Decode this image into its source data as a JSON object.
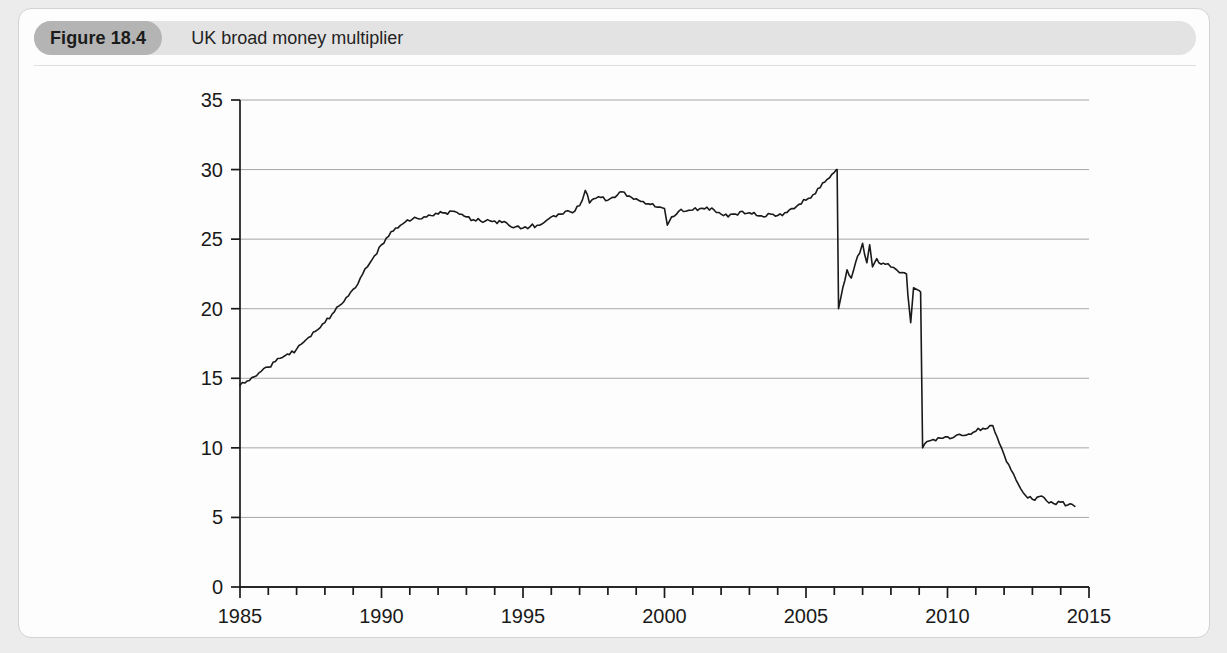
{
  "figure": {
    "number_label": "Figure 18.4",
    "title": "UK broad money multiplier"
  },
  "chart_data": {
    "type": "line",
    "title": "UK broad money multiplier",
    "xlabel": "",
    "ylabel": "",
    "xlim": [
      1985,
      2015
    ],
    "ylim": [
      0,
      35
    ],
    "grid": true,
    "legend": false,
    "y_ticks": [
      0,
      5,
      10,
      15,
      20,
      25,
      30,
      35
    ],
    "y_tick_labels": [
      "0",
      "5",
      "10",
      "15",
      "20",
      "25",
      "30",
      "35"
    ],
    "x_ticks": [
      1985,
      1990,
      1995,
      2000,
      2005,
      2010,
      2015
    ],
    "x_tick_labels": [
      "1985",
      "1990",
      "1995",
      "2000",
      "2005",
      "2010",
      "2015"
    ],
    "x_minor_tick_interval": 1,
    "line_color": "#1a1a1a",
    "line_width": 1.6,
    "series": [
      {
        "name": "UK broad money multiplier",
        "x": [
          1985.0,
          1985.25,
          1985.5,
          1985.75,
          1986.0,
          1986.25,
          1986.5,
          1986.75,
          1987.0,
          1987.25,
          1987.5,
          1987.75,
          1988.0,
          1988.25,
          1988.5,
          1988.75,
          1989.0,
          1989.25,
          1989.5,
          1989.75,
          1990.0,
          1990.25,
          1990.5,
          1990.75,
          1991.0,
          1991.25,
          1991.5,
          1991.75,
          1992.0,
          1992.25,
          1992.5,
          1992.75,
          1993.0,
          1993.25,
          1993.5,
          1993.75,
          1994.0,
          1994.25,
          1994.5,
          1994.75,
          1995.0,
          1995.25,
          1995.5,
          1995.75,
          1996.0,
          1996.25,
          1996.5,
          1996.75,
          1997.0,
          1997.2,
          1997.35,
          1997.5,
          1997.75,
          1998.0,
          1998.25,
          1998.5,
          1998.75,
          1999.0,
          1999.25,
          1999.5,
          1999.75,
          2000.0,
          2000.1,
          2000.25,
          2000.5,
          2000.75,
          2001.0,
          2001.25,
          2001.5,
          2001.75,
          2002.0,
          2002.25,
          2002.5,
          2002.75,
          2003.0,
          2003.25,
          2003.5,
          2003.75,
          2004.0,
          2004.25,
          2004.5,
          2004.75,
          2005.0,
          2005.25,
          2005.5,
          2005.75,
          2006.0,
          2006.08,
          2006.1,
          2006.15,
          2006.3,
          2006.45,
          2006.6,
          2006.75,
          2006.9,
          2007.0,
          2007.15,
          2007.25,
          2007.35,
          2007.5,
          2007.65,
          2007.8,
          2008.0,
          2008.2,
          2008.4,
          2008.55,
          2008.6,
          2008.7,
          2008.8,
          2008.9,
          2009.0,
          2009.05,
          2009.12,
          2009.2,
          2009.35,
          2009.5,
          2009.75,
          2010.0,
          2010.25,
          2010.5,
          2010.75,
          2011.0,
          2011.25,
          2011.5,
          2011.6,
          2011.75,
          2012.0,
          2012.25,
          2012.5,
          2012.75,
          2013.0,
          2013.25,
          2013.5,
          2013.75,
          2014.0,
          2014.25,
          2014.5
        ],
        "values": [
          14.5,
          14.8,
          15.1,
          15.5,
          15.8,
          16.2,
          16.5,
          16.7,
          17.1,
          17.6,
          18.0,
          18.5,
          19.0,
          19.6,
          20.2,
          20.8,
          21.4,
          22.2,
          23.0,
          23.8,
          24.6,
          25.2,
          25.8,
          26.1,
          26.3,
          26.5,
          26.6,
          26.7,
          26.8,
          26.9,
          27.0,
          26.8,
          26.6,
          26.4,
          26.3,
          26.4,
          26.3,
          26.2,
          26.0,
          25.9,
          25.8,
          25.9,
          26.0,
          26.2,
          26.6,
          26.8,
          27.0,
          26.9,
          27.4,
          28.5,
          27.6,
          27.9,
          28.0,
          27.8,
          28.0,
          28.4,
          28.1,
          27.9,
          27.7,
          27.5,
          27.3,
          27.2,
          26.0,
          26.6,
          27.0,
          27.0,
          27.1,
          27.2,
          27.3,
          27.1,
          26.8,
          26.6,
          26.8,
          27.0,
          26.9,
          26.7,
          26.6,
          26.8,
          26.7,
          26.9,
          27.2,
          27.5,
          27.8,
          28.2,
          28.7,
          29.3,
          29.8,
          30.0,
          30.0,
          20.0,
          21.5,
          22.8,
          22.2,
          23.3,
          24.0,
          24.7,
          23.3,
          24.6,
          23.0,
          23.6,
          23.2,
          23.2,
          23.0,
          22.8,
          22.6,
          22.5,
          21.0,
          19.0,
          21.5,
          21.4,
          21.3,
          21.2,
          10.0,
          10.3,
          10.5,
          10.6,
          10.7,
          10.8,
          10.8,
          10.9,
          11.0,
          11.2,
          11.4,
          11.6,
          11.6,
          10.8,
          9.5,
          8.4,
          7.4,
          6.6,
          6.3,
          6.5,
          6.2,
          6.0,
          6.1,
          5.9,
          5.8
        ]
      }
    ]
  }
}
